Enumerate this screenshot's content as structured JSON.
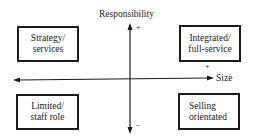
{
  "diagram": {
    "type": "quadrant matrix",
    "y_axis": {
      "label": "Responsibility",
      "positive": "+",
      "negative": "–"
    },
    "x_axis": {
      "label": "Size",
      "positive": "+"
    },
    "quadrants": {
      "top_left": {
        "line1": "Strategy/",
        "line2": "services"
      },
      "top_right": {
        "line1": "Integrated/",
        "line2": "full-service"
      },
      "bottom_left": {
        "line1": "Limited/",
        "line2": "staff role"
      },
      "bottom_right": {
        "line1": "Selling",
        "line2": "orientated"
      }
    },
    "colors": {
      "ink": "#1a1a1a",
      "background": "#ffffff"
    }
  }
}
